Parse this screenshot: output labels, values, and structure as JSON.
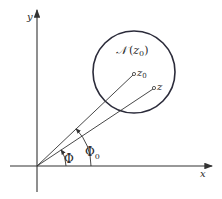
{
  "figure": {
    "axes": {
      "x_label": "x",
      "y_label": "y"
    },
    "neighborhood": {
      "label_script": "𝒩",
      "label_open": "(",
      "label_var": "z",
      "label_sub": "0",
      "label_close": ")"
    },
    "points": [
      {
        "name": "z0",
        "label": "z",
        "subscript": "0"
      },
      {
        "name": "z",
        "label": "z",
        "subscript": ""
      }
    ],
    "angles": [
      {
        "name": "phi",
        "label": "Φ",
        "subscript": ""
      },
      {
        "name": "phi0",
        "label": "Φ",
        "subscript": "0"
      }
    ],
    "colors": {
      "stroke": "#333333",
      "circle": "#2b2b3a",
      "background": "#ffffff"
    }
  }
}
